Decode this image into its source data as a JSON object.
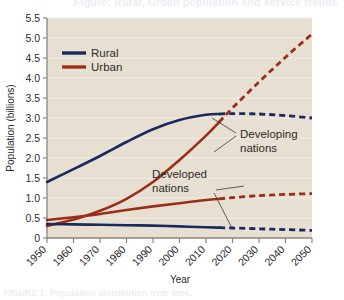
{
  "figure": {
    "top_cut_text": "Figure: Rural, Urban population and service trends",
    "bottom_cut_text": "FIGURE 1. Population distribution over time."
  },
  "axes": {
    "ylabel": "Population (billions)",
    "xlabel": "Year",
    "yticks": [
      "0",
      "0.5",
      "1.0",
      "1.5",
      "2.0",
      "2.5",
      "3.0",
      "3.5",
      "4.0",
      "4.5",
      "5.0",
      "5.5"
    ],
    "xticks": [
      "1950",
      "1960",
      "1970",
      "1980",
      "1990",
      "2000",
      "2010",
      "2020",
      "2030",
      "2040",
      "2050"
    ]
  },
  "legend": {
    "items": [
      {
        "label": "Rural",
        "color": "#1b2a5e"
      },
      {
        "label": "Urban",
        "color": "#9c2d18"
      }
    ]
  },
  "annotations": [
    {
      "name": "developing-nations",
      "line1": "Developing",
      "line2": "nations"
    },
    {
      "name": "developed-nations",
      "line1": "Developed",
      "line2": "nations"
    }
  ],
  "colors": {
    "plot_background": "#e7e0d2",
    "gridline": "#f2eee5",
    "axis": "#8d8577",
    "rural": "#1b2a5e",
    "urban": "#9c2d18",
    "text": "#2b2b2b"
  },
  "chart_data": {
    "type": "line",
    "title": "",
    "xlabel": "Year",
    "ylabel": "Population (billions)",
    "xlim": [
      1950,
      2050
    ],
    "ylim": [
      0,
      5.5
    ],
    "grid": true,
    "legend_position": "top-left",
    "projection_start_year": 2015,
    "x": [
      1950,
      1960,
      1970,
      1980,
      1990,
      2000,
      2010,
      2015,
      2020,
      2030,
      2040,
      2050
    ],
    "series": [
      {
        "name": "Rural — Developing nations",
        "group": "Developing",
        "type": "Rural",
        "color": "#1b2a5e",
        "values": [
          1.4,
          1.72,
          2.05,
          2.4,
          2.72,
          2.95,
          3.08,
          3.1,
          3.11,
          3.1,
          3.06,
          3.0
        ]
      },
      {
        "name": "Urban — Developing nations",
        "group": "Developing",
        "type": "Urban",
        "color": "#9c2d18",
        "values": [
          0.3,
          0.46,
          0.68,
          0.98,
          1.4,
          1.95,
          2.56,
          2.9,
          3.25,
          3.9,
          4.52,
          5.1
        ]
      },
      {
        "name": "Urban — Developed nations",
        "group": "Developed",
        "type": "Urban",
        "color": "#9c2d18",
        "values": [
          0.45,
          0.52,
          0.6,
          0.7,
          0.79,
          0.87,
          0.95,
          0.98,
          1.01,
          1.06,
          1.09,
          1.11
        ]
      },
      {
        "name": "Rural — Developed nations",
        "group": "Developed",
        "type": "Rural",
        "color": "#1b2a5e",
        "values": [
          0.35,
          0.34,
          0.33,
          0.32,
          0.31,
          0.29,
          0.27,
          0.26,
          0.25,
          0.23,
          0.21,
          0.19
        ]
      }
    ]
  }
}
